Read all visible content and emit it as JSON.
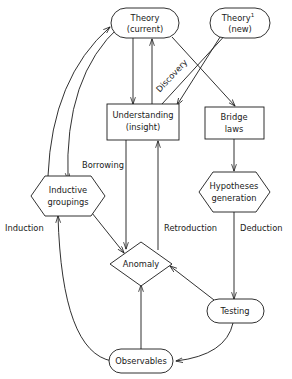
{
  "diagram": {
    "stroke_color": "#1a1a1a",
    "background_color": "#ffffff",
    "nodes": [
      {
        "id": "theory_current",
        "shape": "stadium",
        "lines": [
          "Theory",
          "(current)"
        ]
      },
      {
        "id": "theory_new",
        "shape": "stadium",
        "lines": [
          "Theory",
          "(new)"
        ],
        "superscript": "1"
      },
      {
        "id": "understanding",
        "shape": "rect",
        "lines": [
          "Understanding",
          "(insight)"
        ]
      },
      {
        "id": "bridge_laws",
        "shape": "rect",
        "lines": [
          "Bridge",
          "laws"
        ]
      },
      {
        "id": "inductive_groupings",
        "shape": "hexagon",
        "lines": [
          "Inductive",
          "groupings"
        ]
      },
      {
        "id": "hypotheses_generation",
        "shape": "hexagon",
        "lines": [
          "Hypotheses",
          "generation"
        ]
      },
      {
        "id": "anomaly",
        "shape": "diamond",
        "lines": [
          "Anomaly"
        ]
      },
      {
        "id": "testing",
        "shape": "stadium",
        "lines": [
          "Testing"
        ]
      },
      {
        "id": "observables",
        "shape": "stadium",
        "lines": [
          "Observables"
        ]
      }
    ],
    "edge_labels": [
      {
        "id": "discovery",
        "text": "Discovery",
        "orientation": "diagonal"
      },
      {
        "id": "borrowing",
        "text": "Borrowing",
        "orientation": "horizontal"
      },
      {
        "id": "induction",
        "text": "Induction",
        "orientation": "horizontal"
      },
      {
        "id": "retroduction",
        "text": "Retroduction",
        "orientation": "horizontal"
      },
      {
        "id": "deduction",
        "text": "Deduction",
        "orientation": "horizontal"
      }
    ],
    "edges": [
      {
        "from": "theory_current",
        "to": "understanding"
      },
      {
        "from": "understanding",
        "to": "theory_current"
      },
      {
        "from": "understanding",
        "to": "theory_new",
        "label": "discovery"
      },
      {
        "from": "theory_current",
        "to": "bridge_laws"
      },
      {
        "from": "theory_new",
        "to": "understanding"
      },
      {
        "from": "bridge_laws",
        "to": "hypotheses_generation"
      },
      {
        "from": "hypotheses_generation",
        "to": "testing",
        "label": "deduction"
      },
      {
        "from": "testing",
        "to": "anomaly"
      },
      {
        "from": "testing",
        "to": "observables"
      },
      {
        "from": "observables",
        "to": "anomaly"
      },
      {
        "from": "observables",
        "to": "inductive_groupings",
        "label": "induction"
      },
      {
        "from": "inductive_groupings",
        "to": "theory_current"
      },
      {
        "from": "understanding",
        "to": "inductive_groupings",
        "label": "borrowing"
      },
      {
        "from": "inductive_groupings",
        "to": "anomaly"
      },
      {
        "from": "understanding",
        "to": "anomaly"
      },
      {
        "from": "anomaly",
        "to": "understanding",
        "label": "retroduction"
      }
    ]
  }
}
